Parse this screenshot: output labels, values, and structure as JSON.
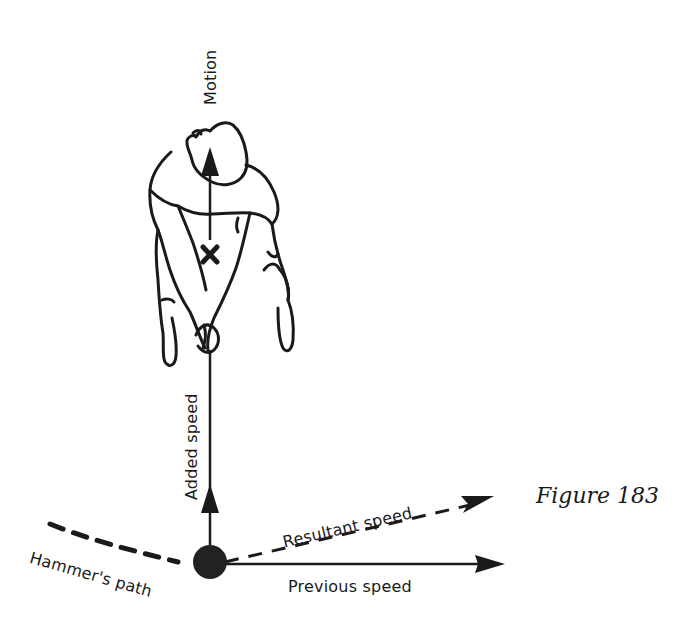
{
  "diagram": {
    "caption": "Figure 183",
    "labels": {
      "motion": "Motion",
      "added_speed": "Added speed",
      "resultant_speed": "Resultant speed",
      "previous_speed": "Previous speed",
      "hammer_path": "Hammer's path"
    },
    "elements": [
      {
        "type": "figure",
        "description": "athlete seen from above, arms extended holding hammer handle"
      },
      {
        "type": "marker",
        "symbol": "×",
        "meaning": "centre of mass"
      },
      {
        "type": "arrow",
        "label": "Motion",
        "direction": "up"
      },
      {
        "type": "arrow",
        "label": "Added speed",
        "direction": "up",
        "style": "solid"
      },
      {
        "type": "arrow",
        "label": "Previous speed",
        "direction": "right",
        "style": "solid"
      },
      {
        "type": "arrow",
        "label": "Resultant speed",
        "direction": "up-right",
        "style": "dashed"
      },
      {
        "type": "path",
        "label": "Hammer's path",
        "style": "dashed curve"
      },
      {
        "type": "ball",
        "meaning": "hammer head"
      }
    ],
    "colors": {
      "ink": "#1a1a1a",
      "background": "#ffffff"
    }
  }
}
